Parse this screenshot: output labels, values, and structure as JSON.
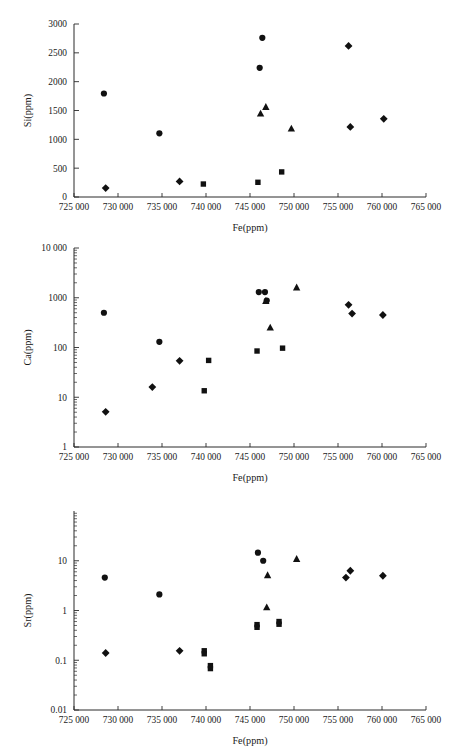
{
  "figure": {
    "background": "#ffffff",
    "marker_color": "#111111",
    "axis_color": "#2a2a2a"
  },
  "chart_data": [
    {
      "id": "si",
      "type": "scatter",
      "title": "",
      "xlabel": "Fe(ppm)",
      "ylabel": "Si(ppm)",
      "xscale": "linear",
      "yscale": "linear",
      "xlim": [
        725000,
        765000
      ],
      "ylim": [
        0,
        3000
      ],
      "grid": false,
      "legend": "none",
      "xticks": [
        725000,
        730000,
        735000,
        740000,
        745000,
        750000,
        755000,
        760000,
        765000
      ],
      "xticklabels": [
        "725 000",
        "730 000",
        "735 000",
        "740 000",
        "745 000",
        "750 000",
        "755 000",
        "760 000",
        "765 000"
      ],
      "yticks": [
        0,
        500,
        1000,
        1500,
        2000,
        2500,
        3000
      ],
      "yticklabels": [
        "0",
        "500",
        "1000",
        "1500",
        "2000",
        "2500",
        "3000"
      ],
      "series": [
        {
          "name": "circle",
          "marker": "circle",
          "points": [
            {
              "x": 728400,
              "y": 1795
            },
            {
              "x": 734700,
              "y": 1105
            },
            {
              "x": 746100,
              "y": 2240
            },
            {
              "x": 746400,
              "y": 2760
            }
          ]
        },
        {
          "name": "diamond",
          "marker": "diamond",
          "points": [
            {
              "x": 728600,
              "y": 155
            },
            {
              "x": 737000,
              "y": 270
            },
            {
              "x": 756200,
              "y": 2620
            },
            {
              "x": 756400,
              "y": 1215
            },
            {
              "x": 760200,
              "y": 1355
            }
          ]
        },
        {
          "name": "triangle",
          "marker": "triangle",
          "points": [
            {
              "x": 746200,
              "y": 1445
            },
            {
              "x": 746800,
              "y": 1560
            },
            {
              "x": 749700,
              "y": 1185
            }
          ]
        },
        {
          "name": "square",
          "marker": "square",
          "points": [
            {
              "x": 739700,
              "y": 225
            },
            {
              "x": 745900,
              "y": 255
            },
            {
              "x": 748600,
              "y": 435
            }
          ]
        }
      ]
    },
    {
      "id": "ca",
      "type": "scatter",
      "title": "",
      "xlabel": "Fe(ppm)",
      "ylabel": "Ca(ppm)",
      "xscale": "linear",
      "yscale": "log",
      "xlim": [
        725000,
        765000
      ],
      "ylim": [
        1,
        10000
      ],
      "grid": false,
      "legend": "none",
      "xticks": [
        725000,
        730000,
        735000,
        740000,
        745000,
        750000,
        755000,
        760000,
        765000
      ],
      "xticklabels": [
        "725 000",
        "730 000",
        "735 000",
        "740 000",
        "745 000",
        "750 000",
        "755 000",
        "760 000",
        "765 000"
      ],
      "yticks": [
        1,
        10,
        100,
        1000,
        10000
      ],
      "yticklabels": [
        "1",
        "10",
        "100",
        "1000",
        "10 000"
      ],
      "series": [
        {
          "name": "circle",
          "marker": "circle",
          "points": [
            {
              "x": 728400,
              "y": 500
            },
            {
              "x": 734700,
              "y": 130
            },
            {
              "x": 746000,
              "y": 1300
            },
            {
              "x": 746700,
              "y": 1300
            },
            {
              "x": 746900,
              "y": 880
            }
          ]
        },
        {
          "name": "diamond",
          "marker": "diamond",
          "points": [
            {
              "x": 728600,
              "y": 5.1
            },
            {
              "x": 733900,
              "y": 16
            },
            {
              "x": 737000,
              "y": 54
            },
            {
              "x": 756200,
              "y": 720
            },
            {
              "x": 756600,
              "y": 480
            },
            {
              "x": 760100,
              "y": 450
            }
          ]
        },
        {
          "name": "triangle",
          "marker": "triangle",
          "points": [
            {
              "x": 746800,
              "y": 860
            },
            {
              "x": 747300,
              "y": 250
            },
            {
              "x": 750300,
              "y": 1600
            }
          ]
        },
        {
          "name": "square",
          "marker": "square",
          "points": [
            {
              "x": 739800,
              "y": 13.5
            },
            {
              "x": 740300,
              "y": 55
            },
            {
              "x": 745800,
              "y": 85
            },
            {
              "x": 748700,
              "y": 97
            }
          ]
        }
      ]
    },
    {
      "id": "sr",
      "type": "scatter",
      "title": "",
      "xlabel": "Fe(ppm)",
      "ylabel": "Sr(ppm)",
      "xscale": "linear",
      "yscale": "log",
      "xlim": [
        725000,
        765000
      ],
      "ylim": [
        0.01,
        100
      ],
      "grid": false,
      "legend": "none",
      "xticks": [
        725000,
        730000,
        735000,
        740000,
        745000,
        750000,
        755000,
        760000,
        765000
      ],
      "xticklabels": [
        "725 000",
        "730 000",
        "735 000",
        "740 000",
        "745 000",
        "750 000",
        "755 000",
        "760 000",
        "765 000"
      ],
      "yticks": [
        0.01,
        0.1,
        1,
        10
      ],
      "yticklabels": [
        "0.01",
        "0.1",
        "1",
        "10"
      ],
      "series": [
        {
          "name": "circle",
          "marker": "circle",
          "points": [
            {
              "x": 728500,
              "y": 4.6
            },
            {
              "x": 734700,
              "y": 2.1
            },
            {
              "x": 745900,
              "y": 14.5
            },
            {
              "x": 746500,
              "y": 10.0
            }
          ]
        },
        {
          "name": "diamond",
          "marker": "diamond",
          "points": [
            {
              "x": 728600,
              "y": 0.14
            },
            {
              "x": 737000,
              "y": 0.155
            },
            {
              "x": 755900,
              "y": 4.6
            },
            {
              "x": 756400,
              "y": 6.3
            },
            {
              "x": 760100,
              "y": 5.0
            }
          ]
        },
        {
          "name": "triangle",
          "marker": "triangle",
          "points": [
            {
              "x": 747000,
              "y": 5.1
            },
            {
              "x": 746900,
              "y": 1.15
            },
            {
              "x": 750300,
              "y": 10.8
            }
          ]
        },
        {
          "name": "square",
          "marker": "square",
          "points": [
            {
              "x": 739800,
              "y": 0.155
            },
            {
              "x": 739800,
              "y": 0.135
            },
            {
              "x": 740500,
              "y": 0.078
            },
            {
              "x": 740500,
              "y": 0.068
            },
            {
              "x": 745800,
              "y": 0.52
            },
            {
              "x": 745800,
              "y": 0.46
            },
            {
              "x": 748300,
              "y": 0.6
            },
            {
              "x": 748300,
              "y": 0.53
            }
          ]
        }
      ]
    }
  ]
}
